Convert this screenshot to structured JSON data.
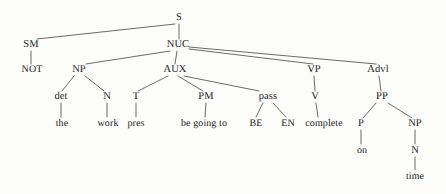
{
  "diagram": {
    "type": "syntax-tree",
    "sentence": "NOT the work pres be going to BE EN complete on time",
    "colors": {
      "background": "#fdfdfc",
      "line": "#5a5a58",
      "text": "#1a1a1a"
    },
    "nodes": [
      {
        "id": "S",
        "label": "S",
        "x": 179,
        "y": 18,
        "kind": "nonterminal"
      },
      {
        "id": "SM",
        "label": "SM",
        "x": 31,
        "y": 45,
        "kind": "nonterminal"
      },
      {
        "id": "NUC",
        "label": "NUC",
        "x": 178,
        "y": 45,
        "kind": "nonterminal"
      },
      {
        "id": "NOT",
        "label": "NOT",
        "x": 32,
        "y": 70,
        "kind": "terminal"
      },
      {
        "id": "NP1",
        "label": "NP",
        "x": 79,
        "y": 70,
        "kind": "nonterminal"
      },
      {
        "id": "AUX",
        "label": "AUX",
        "x": 175,
        "y": 70,
        "kind": "nonterminal"
      },
      {
        "id": "VP",
        "label": "VP",
        "x": 314,
        "y": 70,
        "kind": "nonterminal"
      },
      {
        "id": "Advl",
        "label": "Advl",
        "x": 378,
        "y": 70,
        "kind": "nonterminal"
      },
      {
        "id": "det",
        "label": "det",
        "x": 61,
        "y": 97,
        "kind": "nonterminal"
      },
      {
        "id": "N1",
        "label": "N",
        "x": 107,
        "y": 97,
        "kind": "nonterminal"
      },
      {
        "id": "T",
        "label": "T",
        "x": 136,
        "y": 97,
        "kind": "nonterminal"
      },
      {
        "id": "PM",
        "label": "PM",
        "x": 206,
        "y": 97,
        "kind": "nonterminal"
      },
      {
        "id": "pass",
        "label": "pass",
        "x": 268,
        "y": 97,
        "kind": "nonterminal"
      },
      {
        "id": "V",
        "label": "V",
        "x": 315,
        "y": 97,
        "kind": "nonterminal"
      },
      {
        "id": "PP",
        "label": "PP",
        "x": 382,
        "y": 97,
        "kind": "nonterminal"
      },
      {
        "id": "the",
        "label": "the",
        "x": 62,
        "y": 124,
        "kind": "terminal"
      },
      {
        "id": "work",
        "label": "work",
        "x": 108,
        "y": 124,
        "kind": "terminal"
      },
      {
        "id": "pres",
        "label": "pres",
        "x": 136,
        "y": 124,
        "kind": "terminal"
      },
      {
        "id": "begoingto",
        "label": "be going to",
        "x": 204,
        "y": 124,
        "kind": "terminal"
      },
      {
        "id": "BE",
        "label": "BE",
        "x": 256,
        "y": 124,
        "kind": "terminal"
      },
      {
        "id": "EN",
        "label": "EN",
        "x": 288,
        "y": 124,
        "kind": "terminal"
      },
      {
        "id": "complete",
        "label": "complete",
        "x": 324,
        "y": 124,
        "kind": "terminal"
      },
      {
        "id": "P",
        "label": "P",
        "x": 361,
        "y": 124,
        "kind": "nonterminal"
      },
      {
        "id": "NP2",
        "label": "NP",
        "x": 415,
        "y": 124,
        "kind": "nonterminal"
      },
      {
        "id": "on",
        "label": "on",
        "x": 362,
        "y": 151,
        "kind": "terminal"
      },
      {
        "id": "N2",
        "label": "N",
        "x": 415,
        "y": 151,
        "kind": "nonterminal"
      },
      {
        "id": "time",
        "label": "time",
        "x": 415,
        "y": 177,
        "kind": "terminal"
      }
    ],
    "edges": [
      {
        "from": "S",
        "to": "SM",
        "x1": 175,
        "y1": 24,
        "x2": 37,
        "y2": 39
      },
      {
        "from": "S",
        "to": "NUC",
        "x1": 179,
        "y1": 24,
        "x2": 179,
        "y2": 39
      },
      {
        "from": "SM",
        "to": "NOT",
        "x1": 31,
        "y1": 51,
        "x2": 31,
        "y2": 64
      },
      {
        "from": "NUC",
        "to": "NP1",
        "x1": 170,
        "y1": 51,
        "x2": 86,
        "y2": 64
      },
      {
        "from": "NUC",
        "to": "AUX",
        "x1": 177,
        "y1": 51,
        "x2": 175,
        "y2": 64
      },
      {
        "from": "NUC",
        "to": "VP",
        "x1": 189,
        "y1": 49,
        "x2": 313,
        "y2": 64
      },
      {
        "from": "NUC",
        "to": "Advl",
        "x1": 189,
        "y1": 47,
        "x2": 376,
        "y2": 64
      },
      {
        "from": "NP1",
        "to": "det",
        "x1": 74,
        "y1": 76,
        "x2": 62,
        "y2": 91
      },
      {
        "from": "NP1",
        "to": "N1",
        "x1": 85,
        "y1": 76,
        "x2": 104,
        "y2": 91
      },
      {
        "from": "AUX",
        "to": "T",
        "x1": 168,
        "y1": 76,
        "x2": 138,
        "y2": 91
      },
      {
        "from": "AUX",
        "to": "PM",
        "x1": 178,
        "y1": 76,
        "x2": 203,
        "y2": 91
      },
      {
        "from": "AUX",
        "to": "pass",
        "x1": 184,
        "y1": 76,
        "x2": 259,
        "y2": 91
      },
      {
        "from": "det",
        "to": "the",
        "x1": 61,
        "y1": 103,
        "x2": 61,
        "y2": 117
      },
      {
        "from": "N1",
        "to": "work",
        "x1": 107,
        "y1": 103,
        "x2": 107,
        "y2": 117
      },
      {
        "from": "T",
        "to": "pres",
        "x1": 136,
        "y1": 103,
        "x2": 136,
        "y2": 117
      },
      {
        "from": "PM",
        "to": "begoingto",
        "x1": 206,
        "y1": 103,
        "x2": 205,
        "y2": 117
      },
      {
        "from": "pass",
        "to": "BE",
        "x1": 263,
        "y1": 103,
        "x2": 256,
        "y2": 117
      },
      {
        "from": "pass",
        "to": "EN",
        "x1": 273,
        "y1": 103,
        "x2": 286,
        "y2": 117
      },
      {
        "from": "VP",
        "to": "V",
        "x1": 314,
        "y1": 76,
        "x2": 315,
        "y2": 91
      },
      {
        "from": "V",
        "to": "complete",
        "x1": 316,
        "y1": 103,
        "x2": 318,
        "y2": 117
      },
      {
        "from": "Advl",
        "to": "PP",
        "x1": 379,
        "y1": 76,
        "x2": 381,
        "y2": 91
      },
      {
        "from": "PP",
        "to": "P",
        "x1": 376,
        "y1": 103,
        "x2": 363,
        "y2": 118
      },
      {
        "from": "PP",
        "to": "NP2",
        "x1": 388,
        "y1": 103,
        "x2": 412,
        "y2": 118
      },
      {
        "from": "P",
        "to": "on",
        "x1": 361,
        "y1": 130,
        "x2": 361,
        "y2": 144
      },
      {
        "from": "NP2",
        "to": "N2",
        "x1": 415,
        "y1": 130,
        "x2": 415,
        "y2": 144
      },
      {
        "from": "N2",
        "to": "time",
        "x1": 415,
        "y1": 157,
        "x2": 415,
        "y2": 170
      }
    ]
  }
}
